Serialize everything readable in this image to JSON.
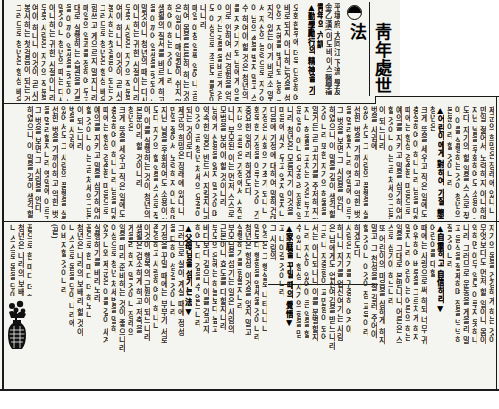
{
  "article": {
    "title": "靑年處世法",
    "byline": [
      "平壤府 大同江 下流 學友會",
      "金乙漢(아도바이스醫學博士)",
      "靑年의 六訓"
    ],
    "subheadings": [
      "▲勤學勵行의 精神을 가질 것▼",
      "▲어린이에게 對하여 가질 態度▼",
      "▲自重하고 自信하라▼",
      "▲家庭을 꾸밀 때의 覺悟▼",
      "▲父母님을 섬기는 法▼"
    ],
    "tiers": [
      {
        "name": "tier-1",
        "columns": [
          "오화한후에 더욱 단련하여야 할것",
          "바로되지 아니하는것을 성명한 바",
          "인의 지혜를 빛내되 능히 그러할",
          "지각 있는 이가 비로소 알수 있는 것",
          "서 자신의 능력으로 자기의 일을",
          "이 남의 손을 빌지 말고 스스로",
          "수 하여야 할 것은 청년의 의무",
          "를 지켜나가되 남에게 의뢰치 말",
          "이로 인하여 산 경험을 얻나니라",
          "이 가는 길을 올바르게 걷는 것",
          "도 이상으로 조금도 틀림이 없이",
          "나니라",
          "매일 아침 일찍 일어나 공부",
          "하여 몸을 튼튼히 하는 것이 좋",
          "은 일이니 매일같이 쉬지 말고",
          "하여야 하는 것이니라",
          "생활의 질서를 바르게 하고 시간",
          "을 아끼어 일생을 헛되이 보내지",
          "말것이니 청년의 때는 다시 오지",
          "아니하는 귀한 시절이니라",
          "무릇 사람은 자기의 직분을 다하",
          "여야 하나니 이것이 곧 사회에",
          "봉사하는 첫걸음이 되는 것이라",
          "그러므로 청년은 항상 배우기를",
          "힘쓰고 게으르지 말지니라",
          "매일의 일과를 정하여 두고 그",
          "대로 실행하는 습관을 기를 것"
        ]
      },
      {
        "name": "tier-2",
        "columns": [
          "제군의 희망은 장래에 있나니",
          "만일 젊어서 노력하지 아니하면",
          "지난 날을 후회하여도 소용이 없",
          "도다 자기의 할 일을 스스로 찾",
          "아 이를 실행하는 것이 청년의",
          "본분이라 할 것이니라",
          "청년은",
          "크게 뜻을 세우고 작은 일에도",
          "충실하여야 하나니라 남을 대할",
          "때에는 항상 겸손한 마음으로",
          "예의를 지키고 말을 삼가하여야",
          "할 것이니 이는 곧 처세의 근본",
          "이 되느니라",
          "벗을 사귐에",
          "있어서도 그 사람의 품행을 살펴",
          "선한 벗을 가까이하고 악한 벗",
          "을 멀리할지니라 옛말에 이르기를",
          "그 벗을 보면 그 사람을 안다",
          "하였으니 이 말을 깊이 생각할",
          "것이니라 또한 자기의 허물을",
          "알거든 곧 고치기를 주저하지 말",
          "지니 허물을 고치는 것은 부끄러",
          "운 일이 아니요 오히려 장한 일이",
          "니라 청년은 모름지기 이것을",
          "마음에 새겨 두고 잊지 말지니라",
          "다음에 가정에 대하여 말하건대",
          "가정은 사회의 기초가 되나니",
          "화목한 가정을 이루는 것이 가장",
          "중요한 일이라 하겠도다",
          "자녀의 교육은 가정에서 시작되",
          "나니 부모된 이는 먼저 스스로",
          "모범을 보여야 할 것이니라",
          "남에게 신용을 잃지 말 것이며",
          "약속한 일은 반드시 지킬지니라",
          "이것이 곧 청년 처세의 요결이",
          "되는 것이로다"
        ]
      },
      {
        "name": "tier-3",
        "columns": [
          "자기의 몸을 건강하게 하는 것이",
          "무엇보다도 먼저 할 일이니 몸이",
          "약하면 아무 일도 이루지 못하나",
          "니라 그러므로 운동을 게을리 말",
          "고 음식을 절제하며 잠을 넉넉히",
          "잘 것이니라",
          "어린이를 대할",
          "때에는 사랑으로써 하되 너무 귀",
          "여워하여 버릇을 그르치게 하지",
          "말지니라 어린이는 어른의 하는",
          "일을 그대로 본받나니 어른은 스",
          "스로 삼가야 하느니라",
          "또 어린이의 마음을 상하게 하지",
          "말고 그 천성을 잘 길러 주어야",
          "할 것이니 이것이 참 교육이라",
          "하겠도다",
          "사람은 자기를 귀중히 여겨야",
          "하나니 자기를 업신여기는 사람",
          "은 남에게도 업신여김을 받느니라",
          "그러나 자중함이 교만함이 되어",
          "서는 아니되나니 이를 분별할지",
          "니라 자신이 있어야 큰 일을 할",
          "수 있나니 항상 자기의 힘을 믿",
          "고 나아갈 것이니라",
          "그 사람의",
          "인격은 그 행실로 나타나나니",
          "말보다 행함을 앞세울 것이니라",
          "청년은 항상 이것을 잊지 말고",
          "실행하기를 힘쓸지니라",
          "부모님을 섬기는 일은 사람의",
          "근본이니 효도를 다할지니라",
          "부모의 은혜는 하늘보다 높고",
          "바다보다 깊으니 이를 갚고자",
          "하여도 다 갚을 수 없느니라",
          "그러므로 살아 계실 때에 정성",
          "을 다하여 섬길 것이니라",
          "가정을 꾸밀 때에는 부부가 서로",
          "존경하고 사랑하여야 하나니",
          "이것이 행복의 근원이 되느니라",
          "생활은 검소하게 하고 저축을",
          "게을리 하지 말 것이니 장래의",
          "일을 미리 준비하는 것이 좋으니라",
          "이상으로 청년 처세법을 말하",
          "였거니와 제군은 이를 깊이 새겨",
          "실행하기를 바라노라",
          "끝으로 한 마디 더 하노니",
          "청년은 나라의 보배라 할 것이",
          "니 스스로 몸을 닦아 나라에",
          "이바지할 것이니라",
          "(끝)"
        ]
      }
    ]
  },
  "illustration": {
    "label": "vase-with-flowers"
  },
  "colors": {
    "paper": "#f4f4f1",
    "ink": "#1e1e1e",
    "rule": "#1a1a1a",
    "margin": "#ffffff"
  }
}
